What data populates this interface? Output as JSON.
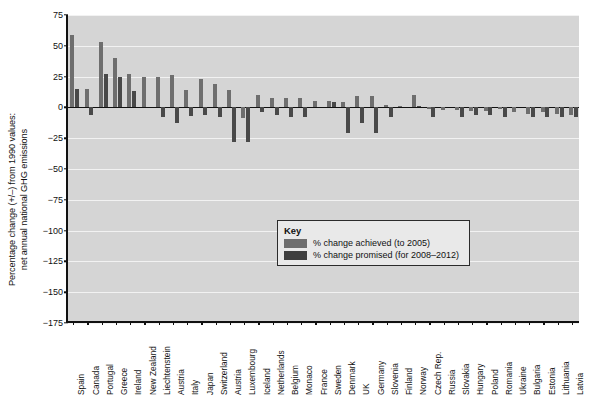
{
  "chart_data": {
    "type": "bar",
    "title": "",
    "xlabel": "",
    "ylabel": "Percentage change (+/–) from 1990 values: net annual national GHG emissions",
    "ylabel_line1": "Percentage change (+/–) from 1990 values:",
    "ylabel_line2": "net annual national GHG emissions",
    "ylim": [
      -175,
      75
    ],
    "ytick_step": 25,
    "yticks": [
      75,
      50,
      25,
      0,
      -25,
      -50,
      -75,
      -100,
      -125,
      -150,
      -175
    ],
    "ytick_labels": [
      "75",
      "50",
      "25",
      "0",
      "−25",
      "−50",
      "−75",
      "−100",
      "−125",
      "−150",
      "−175"
    ],
    "grid": true,
    "legend_position": "inside-center",
    "categories": [
      "Spain",
      "Canada",
      "Portugal",
      "Greece",
      "Ireland",
      "New Zealand",
      "Liechtenstein",
      "Austria",
      "Italy",
      "Japan",
      "Switzerland",
      "Austria",
      "Luxembourg",
      "Iceland",
      "Netherlands",
      "Belgium",
      "Monaco",
      "France",
      "Sweden",
      "Denmark",
      "UK",
      "Germany",
      "Slovenia",
      "Finland",
      "Norway",
      "Czech Rep.",
      "Russia",
      "Slovakia",
      "Hungary",
      "Poland",
      "Romania",
      "Ukraine",
      "Bulgaria",
      "Estonia",
      "Lithuania",
      "Latvia"
    ],
    "series": [
      {
        "name": "% change achieved (to 2005)",
        "color": "#6e6e6e",
        "values": [
          59,
          15,
          53,
          40,
          27,
          25,
          25,
          26,
          14,
          23,
          19,
          14,
          -9,
          10,
          8,
          8,
          8,
          5,
          5,
          4,
          9,
          9,
          2,
          1,
          10,
          -1,
          -2,
          -2,
          -3,
          -3,
          -1,
          -4,
          -5,
          -4,
          -5,
          -6
        ]
      },
      {
        "name": "% change promised (for 2008–2012)",
        "color": "#494949",
        "values": [
          15,
          -6,
          27,
          25,
          13,
          0,
          -8,
          -13,
          -6.5,
          -6,
          -8,
          -28,
          -28,
          -4,
          -6,
          -7.5,
          -8,
          0,
          4,
          -21,
          -12.5,
          -21,
          -8,
          0,
          1,
          -8,
          0,
          -8,
          -6,
          -6,
          -8,
          0,
          -8,
          -8,
          -8,
          -8
        ]
      }
    ],
    "series_alt_note": "",
    "legend": {
      "title": "Key",
      "entries": [
        {
          "label": "% change achieved (to 2005)",
          "color": "#6e6e6e"
        },
        {
          "label": "% change promised (for 2008–2012)",
          "color": "#3f3f3f"
        }
      ]
    },
    "colors": {
      "plot_background": "#d5d5d5",
      "gridline": "#f2f2f2",
      "axis": "#111111",
      "achieved": "#6e6e6e",
      "promised": "#494949"
    }
  },
  "bar_overrides": {
    "note": "explicit per-country measured values used for rendering",
    "achieved": [
      59,
      15,
      53,
      40,
      27,
      25,
      25,
      26,
      14,
      23,
      19,
      14,
      -9,
      10,
      8,
      8,
      8,
      5,
      5,
      4,
      9,
      9,
      2,
      1,
      10,
      -1,
      -2,
      -2,
      -3,
      -3,
      -1,
      -4,
      -5,
      -4,
      -5,
      -6
    ],
    "promised": [
      15,
      -6,
      27,
      25,
      13,
      0,
      -8,
      -13,
      -7,
      -6,
      -8,
      -28,
      -28,
      -4,
      -6,
      -8,
      -8,
      0,
      4,
      -21,
      -13,
      -21,
      -8,
      0,
      1,
      -8,
      0,
      -8,
      -6,
      -6,
      -8,
      0,
      -8,
      -8,
      -8,
      -8
    ]
  }
}
